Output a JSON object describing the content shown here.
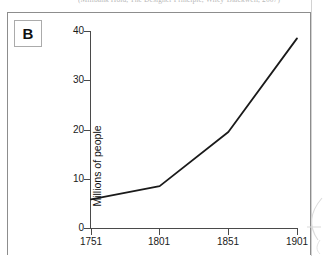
{
  "figure": {
    "panel_label": "B",
    "caption_bleed": "(Millbank Hold, The Designer Principle, Wiley-Blackwell, 2007)"
  },
  "axes": {
    "y_title": "Millions of people",
    "y_ticks": [
      "0",
      "10",
      "20",
      "30",
      "40"
    ],
    "x_ticks": [
      "1751",
      "1801",
      "1851",
      "1901"
    ]
  },
  "chart_data": {
    "type": "line",
    "title": "",
    "xlabel": "",
    "ylabel": "Millions of people",
    "x": [
      1751,
      1801,
      1851,
      1901
    ],
    "values": [
      5.8,
      8.5,
      19.5,
      38.5
    ],
    "series": [
      {
        "name": "Population",
        "values": [
          5.8,
          8.5,
          19.5,
          38.5
        ]
      }
    ],
    "categories": [
      "1751",
      "1801",
      "1851",
      "1901"
    ],
    "xlim": [
      1751,
      1901
    ],
    "ylim": [
      0,
      40
    ],
    "ytick_values": [
      0,
      10,
      20,
      30,
      40
    ],
    "xtick_values": [
      1751,
      1801,
      1851,
      1901
    ],
    "grid": false,
    "legend": "none",
    "line_color": "#1a1a1a"
  }
}
